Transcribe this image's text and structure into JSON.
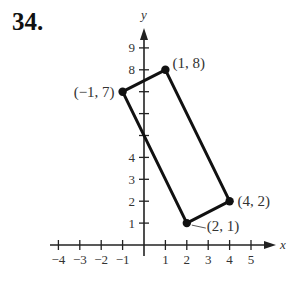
{
  "problem_number": "34.",
  "chart_data": {
    "type": "scatter",
    "title": "",
    "xlabel": "x",
    "ylabel": "y",
    "xlim": [
      -4.5,
      5.5
    ],
    "ylim": [
      -0.5,
      9.8
    ],
    "grid": false,
    "x_ticks": [
      -4,
      -3,
      -2,
      -1,
      1,
      2,
      3,
      4,
      5
    ],
    "x_tick_labels": [
      "−4",
      "−3",
      "−2",
      "−1",
      "1",
      "2",
      "3",
      "4",
      "5"
    ],
    "y_ticks": [
      1,
      2,
      3,
      4,
      5,
      6,
      7,
      8,
      9
    ],
    "y_tick_labels": [
      "1",
      "2",
      "3",
      "4",
      "",
      "",
      "",
      "8",
      "9"
    ],
    "shape": "rectangle",
    "series": [
      {
        "name": "rectangle-vertices",
        "points": [
          {
            "x": -1,
            "y": 7,
            "label": "(−1, 7)"
          },
          {
            "x": 1,
            "y": 8,
            "label": "(1, 8)"
          },
          {
            "x": 4,
            "y": 2,
            "label": "(4, 2)"
          },
          {
            "x": 2,
            "y": 1,
            "label": "(2, 1)"
          }
        ],
        "closed": true
      }
    ]
  }
}
